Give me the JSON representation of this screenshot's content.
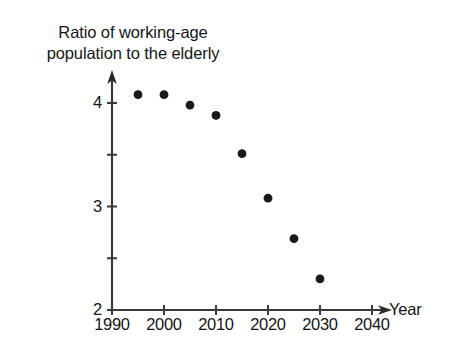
{
  "chart_data": {
    "type": "scatter",
    "title": "Ratio of working-age\npopulation to the elderly",
    "title_line1": "Ratio of working-age",
    "title_line2": "population to the elderly",
    "xlabel": "Year",
    "ylabel": "",
    "xlim": [
      1990,
      2040
    ],
    "ylim": [
      2,
      4.35
    ],
    "grid": false,
    "legend": "none",
    "x_ticks": [
      1990,
      2000,
      2010,
      2020,
      2030,
      2040
    ],
    "x_tick_labels": [
      "1990",
      "2000",
      "2010",
      "2020",
      "2030",
      "2040"
    ],
    "y_ticks": [
      2,
      2.5,
      3,
      3.5,
      4
    ],
    "y_tick_labels": [
      "2",
      "",
      "3",
      "",
      "4"
    ],
    "y_labeled_ticks": [
      "2",
      "3",
      "4"
    ],
    "marker": "filled-circle",
    "marker_color": "#1a1a1a",
    "axis_color": "#3a3a3a",
    "background_color": "#ffffff",
    "x": [
      1995,
      2000,
      2005,
      2010,
      2015,
      2020,
      2025,
      2030
    ],
    "values": [
      4.08,
      4.08,
      3.98,
      3.88,
      3.51,
      3.08,
      2.69,
      2.3
    ],
    "points": [
      {
        "x": 1995,
        "y": 4.08
      },
      {
        "x": 2000,
        "y": 4.08
      },
      {
        "x": 2005,
        "y": 3.98
      },
      {
        "x": 2010,
        "y": 3.88
      },
      {
        "x": 2015,
        "y": 3.51
      },
      {
        "x": 2020,
        "y": 3.08
      },
      {
        "x": 2025,
        "y": 2.69
      },
      {
        "x": 2030,
        "y": 2.3
      }
    ]
  },
  "axes": {
    "x_axis_arrow": true,
    "y_axis_arrow": true,
    "x_axis_label": "Year"
  }
}
